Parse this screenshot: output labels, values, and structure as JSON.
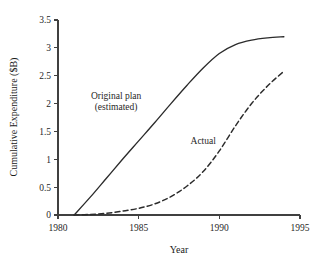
{
  "chart_data": {
    "type": "line",
    "title": "",
    "xlabel": "Year",
    "ylabel": "Cumulative Expenditure ($B)",
    "xlim": [
      1980,
      1995
    ],
    "ylim": [
      0,
      3.5
    ],
    "xticks": [
      "1980",
      "1985",
      "1990",
      "1995"
    ],
    "xtick_values": [
      1980,
      1985,
      1990,
      1995
    ],
    "yticks": [
      "0",
      "0.5",
      "1",
      "1.5",
      "2",
      "2.5",
      "3",
      "3.5"
    ],
    "ytick_values": [
      0,
      0.5,
      1,
      1.5,
      2,
      2.5,
      3,
      3.5
    ],
    "grid": false,
    "legend": "annotations-inline",
    "series": [
      {
        "name": "Original plan (estimated)",
        "style": "solid",
        "color": "#2b2b2b",
        "x": [
          1981.0,
          1982.0,
          1983.0,
          1984.0,
          1985.0,
          1986.0,
          1987.0,
          1988.0,
          1989.0,
          1990.0,
          1991.0,
          1992.0,
          1993.0,
          1994.0
        ],
        "y": [
          0.0,
          0.32,
          0.66,
          1.0,
          1.33,
          1.66,
          2.0,
          2.33,
          2.64,
          2.9,
          3.06,
          3.14,
          3.18,
          3.2
        ]
      },
      {
        "name": "Actual",
        "style": "dashed",
        "color": "#2b2b2b",
        "x": [
          1981.0,
          1982.0,
          1983.0,
          1984.0,
          1985.0,
          1986.0,
          1987.0,
          1988.0,
          1989.0,
          1990.0,
          1991.0,
          1992.0,
          1993.0,
          1994.0
        ],
        "y": [
          0.0,
          0.01,
          0.03,
          0.07,
          0.12,
          0.2,
          0.33,
          0.52,
          0.78,
          1.15,
          1.6,
          2.0,
          2.32,
          2.58
        ]
      }
    ],
    "annotations": [
      {
        "name": "original-plan",
        "line1": "Original plan",
        "line2": "(estimated)",
        "x": 1983.6,
        "y": 2.08
      },
      {
        "name": "actual",
        "line1": "Actual",
        "line2": "",
        "x": 1989.0,
        "y": 1.28
      }
    ]
  },
  "axes": {
    "y_title": "Cumulative Expenditure ($B)",
    "x_title": "Year"
  }
}
